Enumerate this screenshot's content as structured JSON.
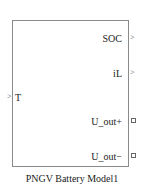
{
  "block": {
    "name": "PNGV Battery Model1",
    "inputs": [
      {
        "label": "T",
        "port_type": "signal-in"
      }
    ],
    "outputs": [
      {
        "label": "SOC",
        "port_type": "signal-out"
      },
      {
        "label": "iL",
        "port_type": "signal-out"
      },
      {
        "label": "U_out+",
        "port_type": "physical-conserving"
      },
      {
        "label": "U_out−",
        "port_type": "physical-conserving"
      }
    ],
    "border_color": "#8a8a8a"
  }
}
